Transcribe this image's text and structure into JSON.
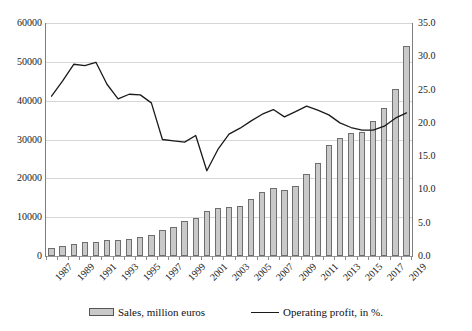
{
  "chart_data": {
    "type": "bar",
    "title": "",
    "xlabel": "",
    "ylabel": "",
    "grid": true,
    "legend_position": "bottom",
    "categories": [
      1987,
      1988,
      1989,
      1990,
      1991,
      1992,
      1993,
      1994,
      1995,
      1996,
      1997,
      1998,
      1999,
      2000,
      2001,
      2002,
      2003,
      2004,
      2005,
      2006,
      2007,
      2008,
      2009,
      2010,
      2011,
      2012,
      2013,
      2014,
      2015,
      2016,
      2017,
      2018,
      2019
    ],
    "x_tick_labels": [
      "1987",
      "",
      "1989",
      "",
      "1991",
      "",
      "1993",
      "",
      "1995",
      "",
      "1997",
      "",
      "1999",
      "",
      "2001",
      "",
      "2003",
      "",
      "2005",
      "",
      "2007",
      "",
      "2009",
      "",
      "2011",
      "",
      "2013",
      "",
      "2015",
      "",
      "2017",
      "",
      "2019"
    ],
    "axes": {
      "left": {
        "label": "",
        "ylim": [
          0,
          60000
        ],
        "ticks": [
          0,
          10000,
          20000,
          30000,
          40000,
          50000,
          60000
        ],
        "tick_labels": [
          "0",
          "10000",
          "20000",
          "30000",
          "40000",
          "50000",
          "60000"
        ]
      },
      "right": {
        "label": "",
        "ylim": [
          0,
          35
        ],
        "ticks": [
          0,
          5,
          10,
          15,
          20,
          25,
          30,
          35
        ],
        "tick_labels": [
          "0.0",
          "5.0",
          "10.0",
          "15.0",
          "20.0",
          "25.0",
          "30.0",
          "35.0"
        ]
      }
    },
    "series": [
      {
        "name": "Sales, million euros",
        "type": "bar",
        "axis": "left",
        "color": "#c9c9c9",
        "edge_color": "#6e6e6e",
        "values": [
          2100,
          2600,
          3200,
          3500,
          3600,
          4000,
          4100,
          4400,
          4900,
          5400,
          6600,
          7500,
          8900,
          9900,
          11700,
          12300,
          12600,
          13000,
          14800,
          16500,
          17500,
          17100,
          18000,
          21000,
          24000,
          28500,
          30300,
          31700,
          32000,
          34800,
          38100,
          43000,
          54000
        ]
      },
      {
        "name": "Operating profit, in %.",
        "type": "line",
        "axis": "right",
        "color": "#1a1a1a",
        "values": [
          24.0,
          26.3,
          28.8,
          28.6,
          29.1,
          25.8,
          23.6,
          24.3,
          24.2,
          23.0,
          17.5,
          17.3,
          17.1,
          18.1,
          12.8,
          16.0,
          18.3,
          19.2,
          20.3,
          21.3,
          22.0,
          20.9,
          21.7,
          22.5,
          21.9,
          21.2,
          20.0,
          19.3,
          18.9,
          18.9,
          19.5,
          20.7,
          21.5
        ]
      }
    ],
    "legend": [
      {
        "label": "Sales, million euros",
        "marker": "bar-swatch"
      },
      {
        "label": "Operating profit, in %.",
        "marker": "line-swatch"
      }
    ]
  }
}
